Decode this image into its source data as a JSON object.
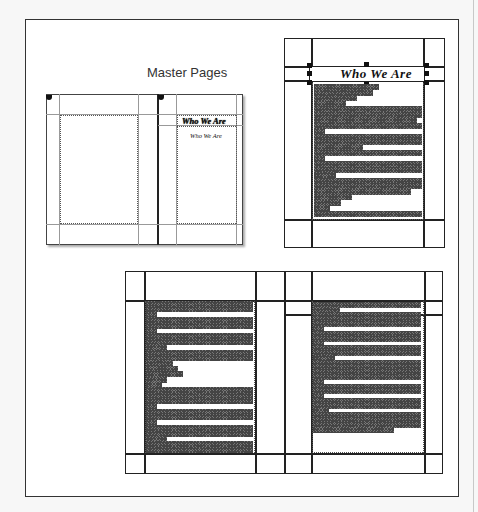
{
  "diagram": {
    "master_pages": {
      "label": "Master Pages",
      "left_page": {
        "heading": ""
      },
      "right_page": {
        "heading": "Who We Are",
        "subheading": "Who We Are"
      }
    },
    "document_page_top_right": {
      "heading": "Who We Are",
      "selected": true,
      "text_lines": [
        60,
        55,
        40,
        30,
        100,
        100,
        95,
        100,
        10,
        100,
        100,
        45,
        100,
        10,
        100,
        100,
        20,
        100,
        100,
        90,
        35,
        25,
        15,
        100
      ]
    },
    "document_page_bottom_left": {
      "text_lines": [
        100,
        100,
        10,
        100,
        100,
        10,
        100,
        100,
        20,
        100,
        100,
        25,
        30,
        35,
        20,
        15,
        100,
        100,
        100,
        10,
        100,
        100,
        10,
        100,
        100,
        20,
        100,
        100
      ]
    },
    "document_page_bottom_right": {
      "text_lines": [
        100,
        25,
        100,
        100,
        100,
        10,
        100,
        100,
        10,
        100,
        100,
        20,
        100,
        100,
        100,
        100,
        10,
        100,
        100,
        10,
        100,
        100,
        15,
        100,
        100,
        100,
        75
      ]
    }
  }
}
